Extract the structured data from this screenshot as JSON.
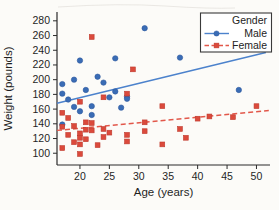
{
  "figure": {
    "background": "#fcfbf8",
    "text_color": "#1f1f1f",
    "spine_color": "#2b2b2b"
  },
  "chart_data": {
    "type": "scatter",
    "title": "",
    "xlabel": "Age (years)",
    "ylabel": "Weight (pounds)",
    "xlim": [
      16.1,
      52.3
    ],
    "ylim": [
      84,
      292
    ],
    "x_ticks": [
      20,
      25,
      30,
      35,
      40,
      45,
      50
    ],
    "y_ticks": [
      100,
      120,
      140,
      160,
      180,
      200,
      220,
      240,
      260,
      280
    ],
    "grid": false,
    "legend": {
      "title": "Gender",
      "position": "top-right",
      "entries": [
        {
          "label": "Male",
          "marker": "circle",
          "color": "#3a6cb5",
          "line_style": "solid"
        },
        {
          "label": "Female",
          "marker": "square",
          "color": "#db4a3c",
          "line_style": "dashed"
        }
      ]
    },
    "series": [
      {
        "name": "Male",
        "marker": "circle",
        "marker_color": "#3a6cb5",
        "marker_edge": "#2b579d",
        "trend_color": "#4c82cc",
        "trend_style": "solid",
        "points": [
          [
            17,
            181
          ],
          [
            17,
            194
          ],
          [
            17,
            139
          ],
          [
            18,
            173
          ],
          [
            19,
            200
          ],
          [
            19,
            163
          ],
          [
            20,
            226
          ],
          [
            20,
            157
          ],
          [
            21,
            186
          ],
          [
            22,
            164
          ],
          [
            22,
            152
          ],
          [
            23,
            204
          ],
          [
            24,
            196
          ],
          [
            25,
            176
          ],
          [
            26,
            229
          ],
          [
            26,
            184
          ],
          [
            27,
            162
          ],
          [
            28,
            177
          ],
          [
            28,
            174
          ],
          [
            31,
            270
          ],
          [
            37,
            230
          ],
          [
            47,
            186
          ]
        ],
        "trend": {
          "x": [
            16.1,
            51.6
          ],
          "y": [
            168,
            237
          ]
        }
      },
      {
        "name": "Female",
        "marker": "square",
        "marker_color": "#db4a3c",
        "marker_edge": "#bf3a2e",
        "trend_color": "#e2574a",
        "trend_style": "dashed",
        "points": [
          [
            17,
            155
          ],
          [
            17,
            136
          ],
          [
            17,
            107
          ],
          [
            18,
            148
          ],
          [
            18,
            125
          ],
          [
            19,
            137
          ],
          [
            19,
            115
          ],
          [
            20,
            170
          ],
          [
            20,
            127
          ],
          [
            20,
            121
          ],
          [
            20,
            112
          ],
          [
            20,
            99
          ],
          [
            21,
            142
          ],
          [
            21,
            132
          ],
          [
            21,
            119
          ],
          [
            22,
            258
          ],
          [
            22,
            141
          ],
          [
            22,
            131
          ],
          [
            23,
            111
          ],
          [
            24,
            176
          ],
          [
            24,
            133
          ],
          [
            24,
            122
          ],
          [
            25,
            128
          ],
          [
            28,
            181
          ],
          [
            28,
            125
          ],
          [
            28,
            116
          ],
          [
            29,
            214
          ],
          [
            31,
            142
          ],
          [
            31,
            130
          ],
          [
            34,
            164
          ],
          [
            34,
            112
          ],
          [
            37,
            133
          ],
          [
            38,
            121
          ],
          [
            40,
            147
          ],
          [
            42,
            150
          ],
          [
            46,
            149
          ],
          [
            50,
            164
          ]
        ],
        "trend": {
          "x": [
            16.1,
            52.1
          ],
          "y": [
            131,
            158
          ]
        }
      }
    ]
  }
}
